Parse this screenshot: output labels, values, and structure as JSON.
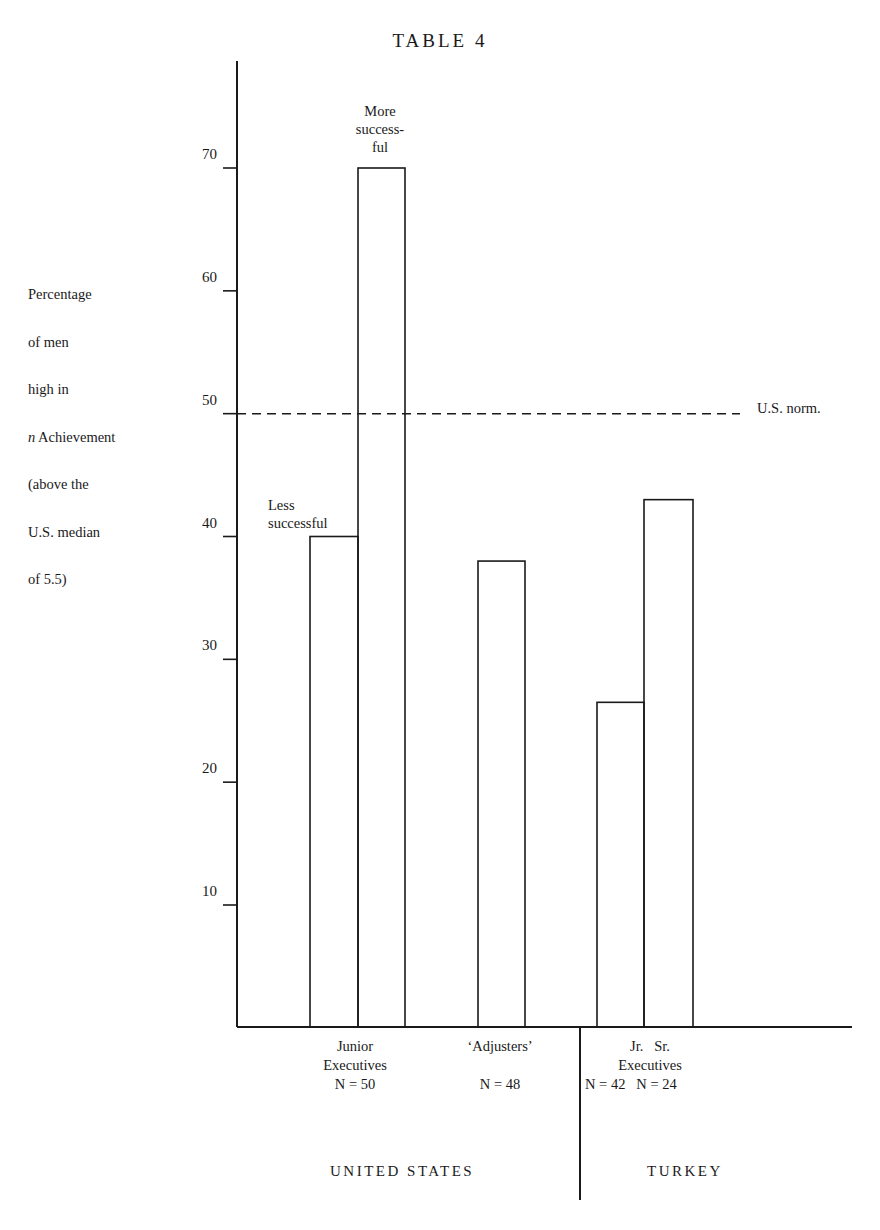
{
  "title": "TABLE 4",
  "y_axis_label_lines": [
    "Percentage",
    "of men",
    "high in",
    "n Achievement",
    "(above the",
    "U.S. median",
    "of 5.5)"
  ],
  "y_ticks": [
    "10",
    "20",
    "30",
    "40",
    "50",
    "60",
    "70"
  ],
  "annotations": {
    "more_successful": [
      "More",
      "success-",
      "ful"
    ],
    "less_successful": [
      "Less",
      "successful"
    ],
    "us_norm": "U.S. norm."
  },
  "categories": {
    "junior_executives": [
      "Junior",
      "Executives",
      "N = 50"
    ],
    "adjusters": [
      "‘Adjusters’",
      "",
      "N = 48"
    ],
    "turkey_exec_top": "Jr.   Sr.",
    "turkey_exec_mid": "Executives",
    "turkey_n_jr": "N = 42",
    "turkey_n_sr": "N = 24"
  },
  "countries": {
    "us": "UNITED STATES",
    "turkey": "TURKEY"
  },
  "colors": {
    "ink": "#1a1a1a",
    "background": "#ffffff"
  },
  "chart_data": {
    "type": "bar",
    "title": "TABLE 4",
    "xlabel": "",
    "ylabel": "Percentage of men high in n Achievement (above the U.S. median of 5.5)",
    "ylim": [
      0,
      78
    ],
    "yticks": [
      10,
      20,
      30,
      40,
      50,
      60,
      70
    ],
    "grid": false,
    "reference_line": {
      "label": "U.S. norm.",
      "value": 50,
      "style": "dashed"
    },
    "groups": [
      {
        "country": "UNITED STATES",
        "name": "Junior Executives",
        "n": 50,
        "bars": [
          {
            "label": "Less successful",
            "value": 40
          },
          {
            "label": "More successful",
            "value": 70
          }
        ]
      },
      {
        "country": "UNITED STATES",
        "name": "'Adjusters'",
        "n": 48,
        "bars": [
          {
            "label": "Adjusters",
            "value": 38
          }
        ]
      },
      {
        "country": "TURKEY",
        "name": "Executives",
        "bars": [
          {
            "label": "Jr.",
            "value": 26.5,
            "n": 42
          },
          {
            "label": "Sr.",
            "value": 43,
            "n": 24
          }
        ]
      }
    ],
    "categories": [
      "Junior Exec. (Less successful)",
      "Junior Exec. (More successful)",
      "'Adjusters'",
      "Turkey Jr. Executives",
      "Turkey Sr. Executives"
    ],
    "values": [
      40,
      70,
      38,
      26.5,
      43
    ]
  }
}
